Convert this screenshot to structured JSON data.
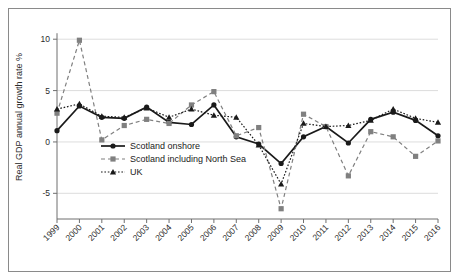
{
  "chart_data": {
    "type": "line",
    "title": "",
    "xlabel": "",
    "ylabel": "Real GDP annual growth rate %",
    "x": [
      1999,
      2000,
      2001,
      2002,
      2003,
      2004,
      2005,
      2006,
      2007,
      2008,
      2009,
      2010,
      2011,
      2012,
      2013,
      2014,
      2015,
      2016
    ],
    "categories": [
      "1999",
      "2000",
      "2001",
      "2002",
      "2003",
      "2004",
      "2005",
      "2006",
      "2007",
      "2008",
      "2009",
      "2010",
      "2011",
      "2012",
      "2013",
      "2014",
      "2015",
      "2016"
    ],
    "xlim": [
      1999,
      2016
    ],
    "ylim": [
      -7.5,
      10.8
    ],
    "yticks": [
      -5,
      0,
      5,
      10
    ],
    "ytick_labels": [
      "-5",
      "0",
      "5",
      "10"
    ],
    "grid": "horizontal",
    "legend_position": "lower-left-inside",
    "series": [
      {
        "name": "Scotland onshore",
        "marker": "circle",
        "line_style": "solid",
        "color": "#1a1a1a",
        "values": [
          1.1,
          3.5,
          2.4,
          2.3,
          3.4,
          1.9,
          1.7,
          3.6,
          0.5,
          -0.2,
          -2.1,
          0.5,
          1.5,
          -0.1,
          2.2,
          2.9,
          2.1,
          0.6
        ]
      },
      {
        "name": "Scotland including North Sea",
        "marker": "square",
        "line_style": "dashed",
        "color": "#808080",
        "values": [
          2.8,
          9.9,
          0.2,
          1.6,
          2.2,
          1.8,
          3.6,
          4.9,
          0.6,
          1.4,
          -6.5,
          2.7,
          1.5,
          -3.3,
          1.0,
          0.5,
          -1.4,
          0.1
        ]
      },
      {
        "name": "UK",
        "marker": "triangle",
        "line_style": "dotted",
        "color": "#1a1a1a",
        "values": [
          3.2,
          3.7,
          2.5,
          2.4,
          3.3,
          2.4,
          3.2,
          2.6,
          2.4,
          -0.3,
          -4.1,
          1.8,
          1.5,
          1.6,
          2.1,
          3.2,
          2.3,
          1.9
        ]
      }
    ]
  },
  "legend": {
    "items": [
      {
        "label": "Scotland onshore"
      },
      {
        "label": "Scotland including North Sea"
      },
      {
        "label": "UK"
      }
    ]
  }
}
